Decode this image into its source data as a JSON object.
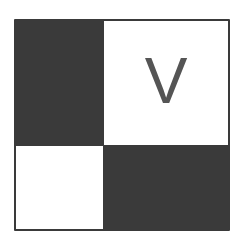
{
  "diagram": {
    "type": "2x2-grid",
    "cells": [
      {
        "position": "top-left",
        "fill": "dark",
        "label": ""
      },
      {
        "position": "top-right",
        "fill": "light",
        "label": "V"
      },
      {
        "position": "bottom-left",
        "fill": "light",
        "label": ""
      },
      {
        "position": "bottom-right",
        "fill": "dark",
        "label": ""
      }
    ],
    "colors": {
      "dark": "#3a3a3a",
      "light": "#ffffff",
      "label": "#555555"
    }
  }
}
